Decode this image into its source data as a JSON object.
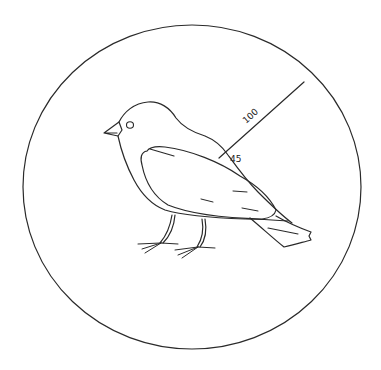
{
  "diagram": {
    "radius_label": "100",
    "angle_label": "45",
    "colors": {
      "line": "#2a2a2a",
      "background": "#ffffff"
    }
  }
}
